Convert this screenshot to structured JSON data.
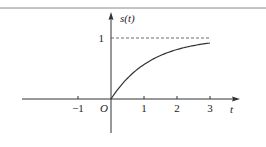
{
  "chart_data": {
    "type": "line",
    "title": "",
    "xlabel": "t",
    "ylabel": "s(t)",
    "origin_label": "O",
    "xlim": [
      -3,
      4
    ],
    "ylim": [
      -0.55,
      1.4
    ],
    "x_ticks": [
      {
        "value": -1,
        "label": "−1"
      },
      {
        "value": 1,
        "label": "1"
      },
      {
        "value": 2,
        "label": "2"
      },
      {
        "value": 3,
        "label": "3"
      }
    ],
    "y_ticks": [
      {
        "value": 1,
        "label": "1"
      }
    ],
    "grid": false,
    "legend": "none",
    "asymptote": {
      "y": 1,
      "style": "dashed",
      "x_range": [
        0,
        3
      ]
    },
    "series": [
      {
        "name": "s(t)",
        "function": "1 - exp(-t/1.2)",
        "x": [
          0,
          0.25,
          0.5,
          0.75,
          1,
          1.25,
          1.5,
          1.75,
          2,
          2.25,
          2.5,
          2.75,
          3
        ],
        "y": [
          0,
          0.19,
          0.34,
          0.46,
          0.57,
          0.65,
          0.71,
          0.77,
          0.81,
          0.85,
          0.88,
          0.9,
          0.92
        ]
      }
    ]
  }
}
